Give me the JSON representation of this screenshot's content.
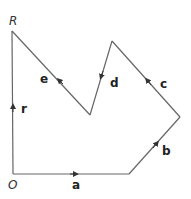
{
  "diagram": {
    "type": "vector-polygon",
    "points": {
      "O": {
        "label": "O",
        "x": 13,
        "y": 174
      },
      "R": {
        "label": "R",
        "x": 12,
        "y": 31
      }
    },
    "vectors": [
      {
        "name": "a",
        "from": [
          13,
          174
        ],
        "to": [
          129,
          174
        ],
        "arrow_at": [
          74,
          174
        ]
      },
      {
        "name": "b",
        "from": [
          129,
          174
        ],
        "to": [
          180,
          117
        ],
        "arrow_at": [
          156,
          144
        ]
      },
      {
        "name": "c",
        "from": [
          180,
          117
        ],
        "to": [
          112,
          41
        ],
        "arrow_at": [
          148,
          81
        ]
      },
      {
        "name": "d",
        "from": [
          112,
          41
        ],
        "to": [
          90,
          115
        ],
        "arrow_at": [
          102,
          75
        ]
      },
      {
        "name": "e",
        "from": [
          90,
          115
        ],
        "to": [
          12,
          31
        ],
        "arrow_at": [
          59,
          80
        ]
      },
      {
        "name": "r",
        "from": [
          13,
          174
        ],
        "to": [
          12,
          31
        ],
        "arrow_at": [
          13,
          108
        ]
      }
    ],
    "colors": {
      "line": "#666666",
      "text": "#222222"
    }
  },
  "labels": {
    "O": "O",
    "R": "R",
    "a": "a",
    "b": "b",
    "c": "c",
    "d": "d",
    "e": "e",
    "r": "r"
  }
}
